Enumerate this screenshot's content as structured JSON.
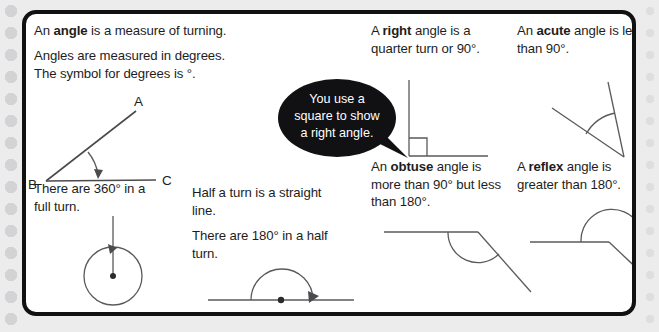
{
  "page": {
    "background_color": "#ececed",
    "card_border_color": "#111111",
    "card_background": "#ffffff",
    "line_color": "#4b4b4f"
  },
  "definitions": {
    "angle_intro": "An angle is a measure of turning.",
    "angle_intro_bold": "angle",
    "degrees": "Angles are measured in degrees.\nThe symbol for degrees is °.",
    "full_turn": "There are 360° in a\nfull turn.",
    "half_turn_line": "Half a turn is a straight\nline.",
    "half_turn_degrees": "There are 180° in a half\nturn.",
    "right": "A right angle is a\nquarter turn or 90°.",
    "right_bold": "right",
    "acute": "An acute angle is less\nthan 90°.",
    "acute_bold": "acute",
    "obtuse": "An obtuse angle is\nmore than 90° but less\nthan 180°.",
    "obtuse_bold": "obtuse",
    "reflex": "A reflex angle is\ngreater than 180°.",
    "reflex_bold": "reflex"
  },
  "speech_bubble": {
    "text": "You use a\nsquare to show\na right angle.",
    "background_color": "#111113",
    "text_color": "#ffffff"
  },
  "labels": {
    "vertex_a": "A",
    "vertex_b": "B",
    "vertex_c": "C"
  },
  "figures": {
    "angle_abc": {
      "name": "angle-abc-diagram",
      "vertex": "B",
      "rays": [
        "A",
        "C"
      ],
      "marked_angle": true
    },
    "full_turn_circle": {
      "name": "full-turn-circle-diagram",
      "degrees": 360,
      "has_center_dot": true,
      "has_arrowhead": true
    },
    "half_turn_line": {
      "name": "half-turn-diagram",
      "degrees": 180,
      "has_center_dot": true,
      "has_arrowhead": true
    },
    "right_angle": {
      "name": "right-angle-diagram",
      "degrees": 90,
      "has_square_marker": true
    },
    "acute_angle": {
      "name": "acute-angle-diagram",
      "degrees_approx": 40,
      "has_arc": true
    },
    "obtuse_angle": {
      "name": "obtuse-angle-diagram",
      "degrees_approx": 135,
      "has_arc": true
    },
    "reflex_angle": {
      "name": "reflex-angle-diagram",
      "degrees_approx": 225,
      "has_arc": true
    }
  }
}
